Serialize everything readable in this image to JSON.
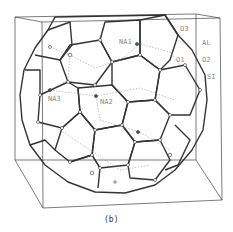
{
  "figure": {
    "caption": "(b)",
    "labels": {
      "o3": "O3",
      "al": "AL",
      "o1": "O1",
      "o2": "O2",
      "si": "SI",
      "na1": "NA1",
      "na2": "NA2",
      "na3": "NA3"
    },
    "colors": {
      "bond": "#333333",
      "box": "#444444",
      "label": "#888888",
      "background": "#ffffff"
    }
  }
}
